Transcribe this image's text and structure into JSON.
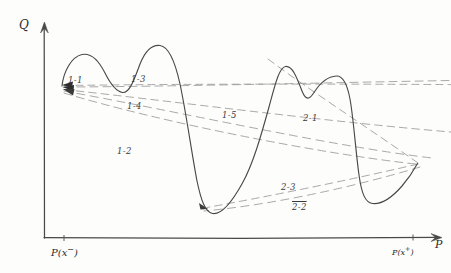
{
  "figure": {
    "kind": "hand-drawn-sketch",
    "background_color": "#fdfdfc",
    "ink_color": "#3a3a3a",
    "dash_color": "#8f8f8f"
  },
  "axes": {
    "y_axis_label": "Q",
    "x_axis_label": "P",
    "x_tick_left_label_base": "P(x",
    "x_tick_left_label_sup": "−",
    "x_tick_left_label_close": ")",
    "x_tick_right_label_base": "P(x",
    "x_tick_right_label_sup": "+",
    "x_tick_right_label_close": ")",
    "y_axis_has_arrow": true,
    "x_axis_has_arrow": true
  },
  "ray_labels": [
    {
      "id": "1-1",
      "text": "1-1",
      "x": 68,
      "y": 75,
      "overline": false
    },
    {
      "id": "1-3",
      "text": "1-3",
      "x": 131,
      "y": 74,
      "overline": false
    },
    {
      "id": "1-4",
      "text": "1-4",
      "x": 127,
      "y": 101,
      "overline": false
    },
    {
      "id": "1-5",
      "text": "1-5",
      "x": 222,
      "y": 110,
      "overline": false
    },
    {
      "id": "2-1",
      "text": "2-1",
      "x": 303,
      "y": 113,
      "overline": false
    },
    {
      "id": "1-2",
      "text": "1-2",
      "x": 117,
      "y": 146,
      "overline": false
    },
    {
      "id": "2-3",
      "text": "2-3",
      "x": 281,
      "y": 182,
      "overline": false
    },
    {
      "id": "2-2",
      "text": "2-2",
      "x": 292,
      "y": 202,
      "overline": true
    }
  ],
  "chart_data": {
    "type": "line",
    "title": "",
    "xlabel": "P",
    "ylabel": "Q",
    "grid": false,
    "legend": "none",
    "note": "Hand-sketched Q-P curve with a family of straight dashed chord/ray lines annotated 1-1 through 2-3.",
    "main_curve_points": [
      [
        62,
        85
      ],
      [
        66,
        72
      ],
      [
        73,
        60
      ],
      [
        82,
        54
      ],
      [
        90,
        55
      ],
      [
        99,
        62
      ],
      [
        108,
        77
      ],
      [
        116,
        89
      ],
      [
        123,
        92
      ],
      [
        130,
        84
      ],
      [
        138,
        66
      ],
      [
        147,
        50
      ],
      [
        157,
        45
      ],
      [
        167,
        49
      ],
      [
        176,
        65
      ],
      [
        185,
        101
      ],
      [
        193,
        145
      ],
      [
        199,
        182
      ],
      [
        205,
        205
      ],
      [
        212,
        213
      ],
      [
        222,
        210
      ],
      [
        234,
        196
      ],
      [
        246,
        170
      ],
      [
        257,
        137
      ],
      [
        266,
        104
      ],
      [
        274,
        79
      ],
      [
        281,
        67
      ],
      [
        289,
        68
      ],
      [
        297,
        81
      ],
      [
        305,
        96
      ],
      [
        312,
        97
      ],
      [
        320,
        90
      ],
      [
        329,
        82
      ],
      [
        338,
        77
      ],
      [
        345,
        80
      ],
      [
        350,
        95
      ],
      [
        354,
        122
      ],
      [
        357,
        153
      ],
      [
        361,
        181
      ],
      [
        366,
        197
      ],
      [
        373,
        203
      ],
      [
        383,
        201
      ],
      [
        394,
        193
      ],
      [
        404,
        181
      ],
      [
        412,
        170
      ],
      [
        417,
        164
      ]
    ],
    "dashed_rays": [
      {
        "id": "1-1",
        "from": [
          62,
          85
        ],
        "to": [
          451,
          84
        ],
        "label": "1-1"
      },
      {
        "id": "1-3",
        "from": [
          62,
          85
        ],
        "to": [
          451,
          82
        ],
        "label": "1-3"
      },
      {
        "id": "1-4",
        "from": [
          62,
          88
        ],
        "to": [
          451,
          130
        ],
        "label": "1-4"
      },
      {
        "id": "1-5",
        "from": [
          62,
          88
        ],
        "to": [
          430,
          158
        ],
        "label": "1-5"
      },
      {
        "id": "1-2",
        "from": [
          62,
          92
        ],
        "to": [
          421,
          165
        ],
        "label": "1-2"
      },
      {
        "id": "2-1",
        "from": [
          418,
          163
        ],
        "to": [
          270,
          60
        ],
        "label": "2-1"
      },
      {
        "id": "2-3",
        "from": [
          418,
          163
        ],
        "to": [
          208,
          208
        ],
        "label": "2-3"
      },
      {
        "id": "2-2",
        "from": [
          418,
          166
        ],
        "to": [
          205,
          211
        ],
        "label": "2-2"
      }
    ],
    "axis_geometry": {
      "origin": [
        44,
        238
      ],
      "y_axis_top": [
        44,
        22
      ],
      "x_axis_right": [
        442,
        238
      ],
      "x_tick_left": [
        64,
        238
      ],
      "x_tick_right": [
        413,
        238
      ]
    }
  }
}
